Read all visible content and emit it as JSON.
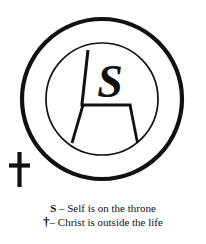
{
  "figure": {
    "title_alt": "Self-directed life diagram",
    "colors": {
      "ink": "#111111",
      "background": "#ffffff"
    },
    "outer_circle": {
      "cx": 102,
      "cy": 99,
      "r": 80,
      "stroke_width": 4
    },
    "inner_circle": {
      "cx": 102,
      "cy": 99,
      "r": 56,
      "stroke_width": 1.6
    },
    "throne": {
      "label": "S",
      "back_post": {
        "x1": 88,
        "y1": 50,
        "x2": 82,
        "y2": 104
      },
      "seat_bar": {
        "x1": 81,
        "y1": 105,
        "x2": 131,
        "y2": 105
      },
      "left_leg": {
        "x1": 83,
        "y1": 106,
        "x2": 72,
        "y2": 142
      },
      "right_leg": {
        "x1": 130,
        "y1": 106,
        "x2": 137,
        "y2": 142
      }
    },
    "cross": {
      "symbol": "†",
      "vertical": {
        "x": 19,
        "y_top": 152,
        "y_bottom": 187,
        "width": 4
      },
      "horizontal": {
        "y": 165,
        "x_left": 9,
        "x_right": 30,
        "height": 4
      }
    }
  },
  "legend": {
    "lines": [
      {
        "symbol": "S",
        "dash": " – ",
        "text": "Self is on the throne"
      },
      {
        "symbol": "†",
        "dash": "– ",
        "text": "Christ is outside the life"
      }
    ],
    "line1_symbol": "S",
    "line1_dash": " – ",
    "line1_text": "Self is on the throne",
    "line2_symbol": "†",
    "line2_dash": "– ",
    "line2_text": "Christ is outside the life"
  }
}
